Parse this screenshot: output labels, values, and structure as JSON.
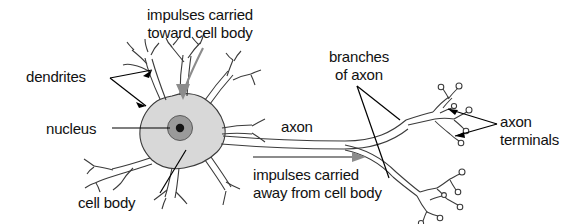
{
  "diagram": {
    "labels": {
      "impulses_toward": "impulses carried\ntoward cell body",
      "dendrites": "dendrites",
      "nucleus": "nucleus",
      "cell_body": "cell body",
      "axon": "axon",
      "branches_of_axon": "branches\nof axon",
      "impulses_away": "impulses carried\naway from cell body",
      "axon_terminals": "axon\nterminals"
    },
    "colors": {
      "background": "#ffffff",
      "text": "#111111",
      "outline": "#3b3b3b",
      "leader_line": "#000000",
      "soma_fill": "#d8d8d8",
      "nucleus_fill": "#9a9a9a",
      "nucleolus_fill": "#141414",
      "motion_arrow": "#8c8c8c"
    },
    "parts": [
      "dendrites",
      "cell body",
      "nucleus",
      "axon",
      "branches of axon",
      "axon terminals"
    ],
    "signal_direction": {
      "toward_cell_body": "impulses carried toward cell body",
      "away_from_cell_body": "impulses carried away from cell body"
    }
  }
}
